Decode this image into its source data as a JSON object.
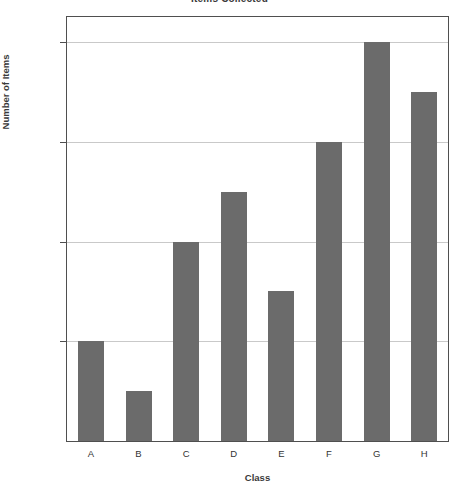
{
  "chart_data": {
    "type": "bar",
    "title": "Items Collected",
    "xlabel": "Class",
    "ylabel": "Number of Items",
    "categories": [
      "A",
      "B",
      "C",
      "D",
      "E",
      "F",
      "G",
      "H"
    ],
    "values": [
      120,
      110,
      140,
      150,
      130,
      160,
      180,
      170
    ],
    "ylim": [
      100,
      185
    ],
    "yticks": [
      100,
      120,
      140,
      160,
      180
    ],
    "ytick_labels": [
      "100",
      "120",
      "140",
      "160",
      "180"
    ],
    "grid": true,
    "grid_axis": "y",
    "legend": null,
    "legend_position": "none",
    "bar_color": "#6b6b6b",
    "frame_color": "#4f4f4f",
    "gridline_color": "#c9c9c9",
    "background_color": "#ffffff",
    "series": [
      {
        "name": "Number of Items",
        "values": [
          120,
          110,
          140,
          150,
          130,
          160,
          180,
          170
        ]
      }
    ],
    "points": [
      {
        "category": "A",
        "value": 120
      },
      {
        "category": "B",
        "value": 110
      },
      {
        "category": "C",
        "value": 140
      },
      {
        "category": "D",
        "value": 150
      },
      {
        "category": "E",
        "value": 130
      },
      {
        "category": "F",
        "value": 160
      },
      {
        "category": "G",
        "value": 180
      },
      {
        "category": "H",
        "value": 170
      }
    ]
  }
}
